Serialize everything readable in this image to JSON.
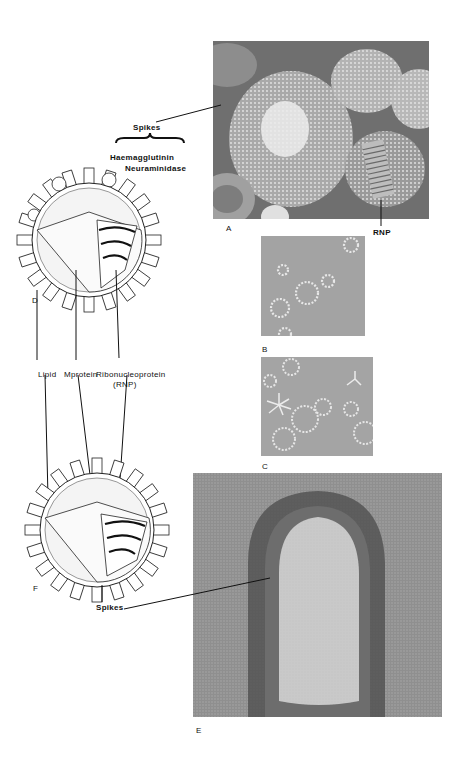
{
  "figure": {
    "panels": [
      {
        "id": "A",
        "label": "A",
        "kind": "electron-micrograph",
        "description": "Spherical virions with surface spikes and released RNP"
      },
      {
        "id": "B",
        "label": "B",
        "kind": "electron-micrograph",
        "description": "Isolated spike rosettes"
      },
      {
        "id": "C",
        "label": "C",
        "kind": "electron-micrograph",
        "description": "Spike rosettes and clusters"
      },
      {
        "id": "D",
        "label": "D",
        "kind": "schematic",
        "description": "Cut-away drawing of spherical virion"
      },
      {
        "id": "E",
        "label": "E",
        "kind": "electron-micrograph",
        "description": "Filamentous virion with spikes"
      },
      {
        "id": "F",
        "label": "F",
        "kind": "schematic",
        "description": "Cut-away drawing of virion"
      }
    ],
    "annotations": {
      "spikes_top": "Spikes",
      "haemagglutinin": "Haemagglutinin",
      "neuraminidase": "Neuraminidase",
      "rnp": "RNP",
      "lipid": "Lipid",
      "mprotein": "Mprotein",
      "ribonucleoprotein": "Ribonucleoprotein",
      "ribonucleoprotein_abbr": "(RNP)",
      "spikes_bottom": "Spikes"
    },
    "colors": {
      "background": "#ffffff",
      "ink": "#111111",
      "micrograph_dark": "#5a5a5a",
      "micrograph_mid": "#8c8c8c",
      "micrograph_light": "#d0d0d0"
    }
  }
}
